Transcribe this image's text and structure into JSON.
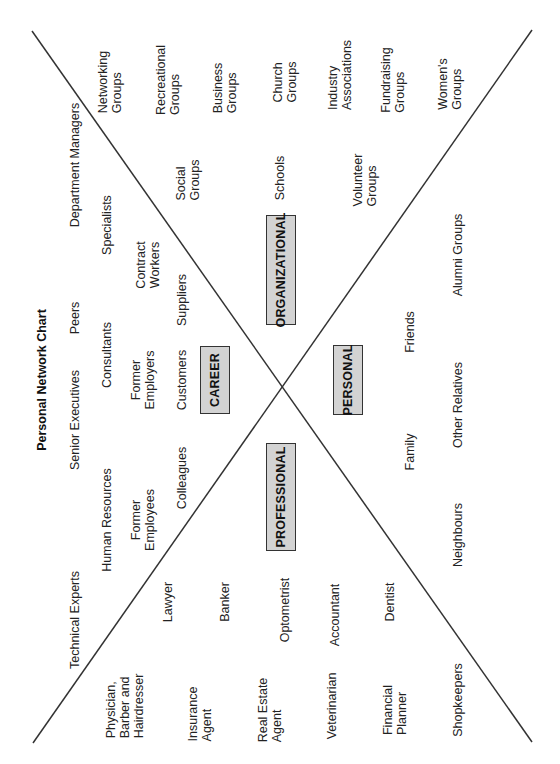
{
  "title": "Personal Network Chart",
  "colors": {
    "line": "#333333",
    "box_fill": "#d3d3d3",
    "box_border": "#333333",
    "text": "#222222"
  },
  "categories": {
    "career": "CAREER",
    "organizational": "ORGANIZATIONAL",
    "personal": "PERSONAL",
    "professional": "PROFESSIONAL"
  },
  "career": {
    "row1": [
      "Technical Experts",
      "Senior Executives",
      "Peers",
      "Department Managers"
    ],
    "row2": [
      "Human Resources",
      "Consultants",
      "Specialists"
    ],
    "row3": [
      "Former\nEmployees",
      "Former\nEmployers",
      "Contract\nWorkers"
    ],
    "row4": [
      "Colleagues",
      "Customers",
      "Suppliers"
    ]
  },
  "organizational": {
    "outer": [
      "Networking\nGroups",
      "Recreational\nGroups",
      "Business\nGroups",
      "Church\nGroups",
      "Industry\nAssociations",
      "Fundraising\nGroups",
      "Women's\nGroups"
    ],
    "inner": [
      "Social\nGroups",
      "Schools",
      "Volunteer\nGroups"
    ]
  },
  "personal": {
    "inner": [
      "Family",
      "Friends"
    ],
    "outer": [
      "Neighbours",
      "Other Relatives",
      "Alumni Groups"
    ]
  },
  "professional": {
    "inner": [
      "Lawyer",
      "Banker",
      "Optometrist",
      "Accountant",
      "Dentist"
    ],
    "outer": [
      "Physician,\nBarber and\nHairdresser",
      "Insurance\nAgent",
      "Real Estate\nAgent",
      "Veterinarian",
      "Financial\nPlanner",
      "Shopkeepers"
    ]
  }
}
